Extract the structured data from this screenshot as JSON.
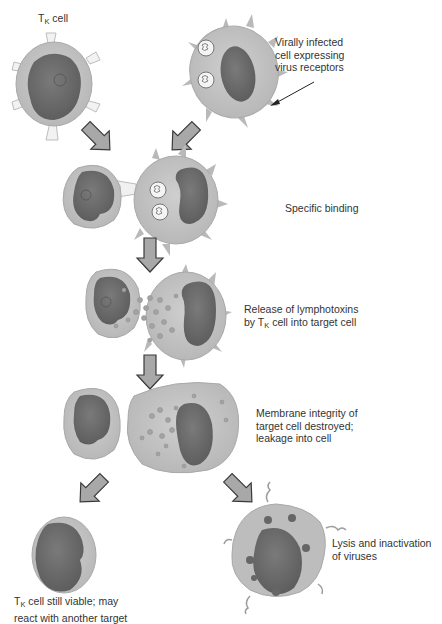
{
  "labels": {
    "tk_cell": {
      "prefix": "T",
      "sub": "K",
      "suffix": " cell"
    },
    "infected_cell": [
      "Virally infected",
      "cell expressing",
      "virus receptors"
    ],
    "step1": "Specific binding",
    "step2": {
      "line1": "Release of lymphotoxins",
      "line2_prefix": "by T",
      "line2_sub": "K",
      "line2_suffix": " cell into target cell"
    },
    "step3": [
      "Membrane integrity of",
      "target cell destroyed;",
      "leakage into cell"
    ],
    "outcome_tk": {
      "line1_prefix": "T",
      "line1_sub": "K",
      "line1_suffix": " cell still viable; may",
      "line2": "react with another target"
    },
    "outcome_target": [
      "Lysis and inactivation",
      "of viruses"
    ]
  },
  "colors": {
    "cytoplasm": "#c4c4c4",
    "cytoplasm_edge": "#b0b0b0",
    "nucleus": "#6e6e6e",
    "arrow_fill": "#a8a8a8",
    "arrow_stroke": "#3a3a3a",
    "granule": "#9a9a9a"
  }
}
